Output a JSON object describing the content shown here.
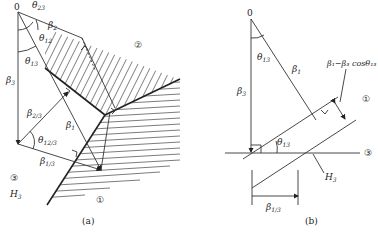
{
  "figure": {
    "panels": [
      {
        "id": "a",
        "caption": "(a)",
        "labels": {
          "origin": "0",
          "theta23": "θ",
          "theta23_sub": "23",
          "theta12": "θ",
          "theta12_sub": "12",
          "theta13": "θ",
          "theta13_sub": "13",
          "beta2": "β",
          "beta2_sub": "2",
          "beta3": "β",
          "beta3_sub": "3",
          "beta23": "β",
          "beta23_sub": "2/3",
          "beta1": "β",
          "beta1_sub": "1",
          "theta123": "θ",
          "theta123_sub": "12/3",
          "beta13": "β",
          "beta13_sub": "1/3",
          "region2": "②",
          "region3": "③",
          "H3": "H",
          "H3_sub": "3",
          "region1": "①"
        }
      },
      {
        "id": "b",
        "caption": "(b)",
        "labels": {
          "origin": "0",
          "theta13": "θ",
          "theta13_sub": "13",
          "beta1": "β",
          "beta1_sub": "1",
          "beta3": "β",
          "beta3_sub": "3",
          "formula": "β₁−β₃ cosθ₁₃",
          "region1": "①",
          "theta13_lower": "θ",
          "theta13_lower_sub": "13",
          "region3": "③",
          "H3": "H",
          "H3_sub": "3",
          "beta13": "β",
          "beta13_sub": "1/3"
        }
      }
    ]
  }
}
